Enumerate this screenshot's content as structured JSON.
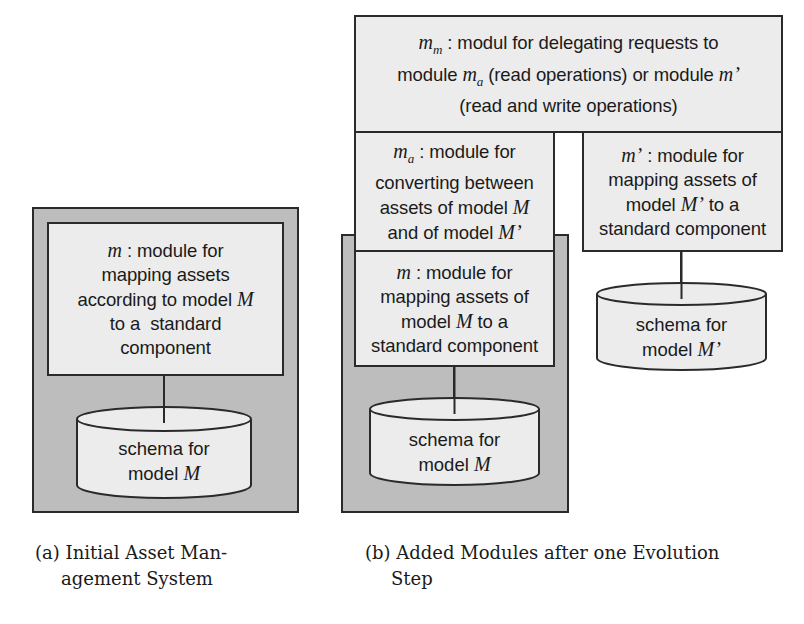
{
  "figure_a": {
    "module_m": {
      "symbol": "m",
      "lines": [
        "module for",
        "mapping assets",
        "according to model",
        "to a  standard",
        "component"
      ],
      "line3_symbol": "M"
    },
    "schema": {
      "line1": "schema for",
      "line2": "model",
      "symbol": "M"
    },
    "caption": {
      "tag": "(a)",
      "line1": "Initial Asset Man-",
      "line2": "agement System"
    }
  },
  "figure_b": {
    "module_mm": {
      "symbol": "m",
      "subscript": "m",
      "line1": "modul for delegating requests to",
      "line2_pre": "module",
      "line2_sym": "m",
      "line2_sub": "a",
      "line2_mid": "(read operations) or module",
      "line2_sym2": "m’",
      "line3": "(read and write operations)"
    },
    "module_ma": {
      "symbol": "m",
      "subscript": "a",
      "line1": "module for",
      "line2": "converting between",
      "line3": "assets of model",
      "line3_sym": "M",
      "line4": "and of model",
      "line4_sym": "M’"
    },
    "module_mprime": {
      "symbol": "m’",
      "line1": "module for",
      "line2": "mapping assets of",
      "line3_pre": "model",
      "line3_sym": "M’",
      "line3_post": "to a",
      "line4": "standard component"
    },
    "module_m": {
      "symbol": "m",
      "line1": "module for",
      "line2": "mapping assets of",
      "line3_pre": "model",
      "line3_sym": "M",
      "line3_post": "to a",
      "line4": "standard component"
    },
    "schema_m": {
      "line1": "schema for",
      "line2": "model",
      "symbol": "M"
    },
    "schema_mprime": {
      "line1": "schema for",
      "line2": "model",
      "symbol": "M’"
    },
    "caption": {
      "tag": "(b)",
      "line1": "Added Modules after one Evolution",
      "line2": "Step"
    }
  },
  "colors": {
    "system_gray": "#bdbdbd",
    "box_fill": "#ececec",
    "stroke": "#2a2a2a"
  }
}
